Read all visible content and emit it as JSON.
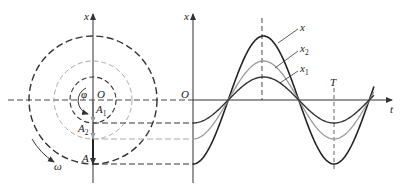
{
  "figure": {
    "type": "phasor-and-waveform diagram",
    "colors": {
      "dark": "#333333",
      "gray": "#999999",
      "background": "#ffffff"
    },
    "left_panel": {
      "axis_label": "x",
      "origin_label": "O",
      "phase_label": "φ",
      "rotation_label": "ω",
      "phasors": [
        {
          "name": "A",
          "label_main": "A",
          "label_sub": "",
          "color": "dark",
          "radius": 64
        },
        {
          "name": "A2",
          "label_main": "A",
          "label_sub": "2",
          "color": "gray",
          "radius": 39
        },
        {
          "name": "A1",
          "label_main": "A",
          "label_sub": "1",
          "color": "dark",
          "radius": 23
        }
      ]
    },
    "right_panel": {
      "x_axis_label": "t",
      "y_axis_label": "x",
      "origin_label": "O",
      "period_label": "T",
      "curves": [
        {
          "name": "x",
          "label_main": "x",
          "label_sub": "",
          "amplitude": 64,
          "color": "dark"
        },
        {
          "name": "x2",
          "label_main": "x",
          "label_sub": "2",
          "amplitude": 39,
          "color": "gray"
        },
        {
          "name": "x1",
          "label_main": "x",
          "label_sub": "1",
          "amplitude": 23,
          "color": "dark"
        }
      ]
    }
  }
}
